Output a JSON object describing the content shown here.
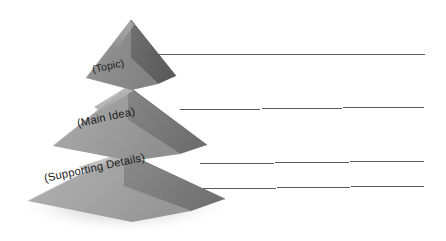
{
  "diagram": {
    "type": "pyramid",
    "tier_count": 3,
    "tiers": [
      {
        "id": "topic",
        "label": "(Topic)",
        "level": 1,
        "position": "top",
        "face_light_color": "#8e8e8e",
        "face_dark_color": "#646464"
      },
      {
        "id": "main-idea",
        "label": "(Main Idea)",
        "level": 2,
        "position": "middle",
        "face_light_color": "#9b9b9b",
        "face_dark_color": "#7a7a7a"
      },
      {
        "id": "supporting-details",
        "label": "(Supporting Details)",
        "level": 3,
        "position": "bottom",
        "face_light_color": "#a2a2a2",
        "face_dark_color": "#818181"
      }
    ],
    "leader_lines": [
      {
        "id": "leader-line-1",
        "from_tier": "topic",
        "x1": 145,
        "y1": 54,
        "x2": 425,
        "y2": 54
      },
      {
        "id": "leader-line-2",
        "from_tier": "main-idea",
        "x1": 180,
        "y1": 110,
        "x2": 425,
        "y2": 107
      },
      {
        "id": "leader-line-3",
        "from_tier": "supporting-details",
        "x1": 200,
        "y1": 164,
        "x2": 425,
        "y2": 161
      },
      {
        "id": "leader-line-4",
        "from_tier": "supporting-details",
        "x1": 203,
        "y1": 189,
        "x2": 425,
        "y2": 186
      }
    ],
    "line_color": "#5a5a5a",
    "background_color": "#ffffff",
    "shadow_color": "#d8d8d8"
  }
}
